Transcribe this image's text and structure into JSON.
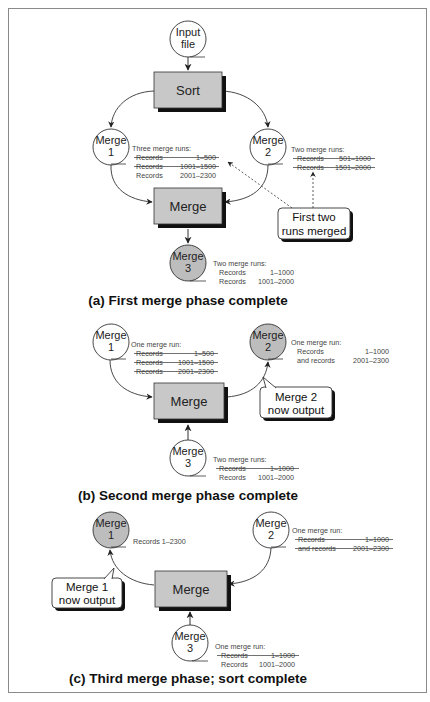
{
  "figure": {
    "colors": {
      "process_box_fill": "#c8c8c8",
      "active_output_fill": "#bdbdbd",
      "node_fill": "#ffffff",
      "stroke": "#333333",
      "frame": "#8a8a8a"
    },
    "panel_a": {
      "caption": "(a) First merge phase complete",
      "input_node": {
        "line1": "Input",
        "line2": "file"
      },
      "sort_box": "Sort",
      "merge_box": "Merge",
      "merge1": {
        "line1": "Merge",
        "line2": "1",
        "active": false
      },
      "merge2": {
        "line1": "Merge",
        "line2": "2",
        "active": false
      },
      "merge3": {
        "line1": "Merge",
        "line2": "3",
        "active": true
      },
      "merge1_runs": {
        "header": "Three merge runs:",
        "rows": [
          {
            "label": "Records",
            "range": "1–500",
            "struck": true
          },
          {
            "label": "Records",
            "range": "1001–1500",
            "struck": true
          },
          {
            "label": "Records",
            "range": "2001–2300",
            "struck": false
          }
        ]
      },
      "merge2_runs": {
        "header": "Two merge runs:",
        "rows": [
          {
            "label": "Records",
            "range": "501–1000",
            "struck": true
          },
          {
            "label": "Records",
            "range": "1501–2000",
            "struck": true
          }
        ]
      },
      "merge3_runs": {
        "header": "Two merge runs:",
        "rows": [
          {
            "label": "Records",
            "range": "1–1000",
            "struck": false
          },
          {
            "label": "Records",
            "range": "1001–2000",
            "struck": false
          }
        ]
      },
      "callout": {
        "line1": "First two",
        "line2": "runs merged"
      }
    },
    "panel_b": {
      "caption": "(b) Second merge phase complete",
      "merge_box": "Merge",
      "merge1": {
        "line1": "Merge",
        "line2": "1",
        "active": false
      },
      "merge2": {
        "line1": "Merge",
        "line2": "2",
        "active": true
      },
      "merge3": {
        "line1": "Merge",
        "line2": "3",
        "active": false
      },
      "merge1_runs": {
        "header": "One merge run:",
        "rows": [
          {
            "label": "Records",
            "range": "1–500",
            "struck": true
          },
          {
            "label": "Records",
            "range": "1001–1500",
            "struck": true
          },
          {
            "label": "Records",
            "range": "2001–2300",
            "struck": true
          }
        ]
      },
      "merge2_runs": {
        "header": "One merge run:",
        "rows": [
          {
            "label": "Records",
            "range": "1–1000",
            "struck": false
          },
          {
            "label": "and records",
            "range": "2001–2300",
            "struck": false
          }
        ]
      },
      "merge3_runs": {
        "header": "Two merge runs:",
        "rows": [
          {
            "label": "Records",
            "range": "1–1000",
            "struck": true
          },
          {
            "label": "Records",
            "range": "1001–2000",
            "struck": false
          }
        ]
      },
      "callout": {
        "line1": "Merge 2",
        "line2": "now output"
      }
    },
    "panel_c": {
      "caption": "(c) Third merge phase; sort complete",
      "merge_box": "Merge",
      "merge1": {
        "line1": "Merge",
        "line2": "1",
        "active": true
      },
      "merge2": {
        "line1": "Merge",
        "line2": "2",
        "active": false
      },
      "merge3": {
        "line1": "Merge",
        "line2": "3",
        "active": false
      },
      "merge1_runs": {
        "header": "Records 1–2300"
      },
      "merge2_runs": {
        "header": "One merge run:",
        "rows": [
          {
            "label": "Records",
            "range": "1–1000",
            "struck": true
          },
          {
            "label": "and records",
            "range": "2001–2300",
            "struck": true
          }
        ]
      },
      "merge3_runs": {
        "header": "One merge run:",
        "rows": [
          {
            "label": "Records",
            "range": "1–1000",
            "struck": true
          },
          {
            "label": "Records",
            "range": "1001–2000",
            "struck": false
          }
        ]
      },
      "callout": {
        "line1": "Merge 1",
        "line2": "now output"
      }
    }
  }
}
